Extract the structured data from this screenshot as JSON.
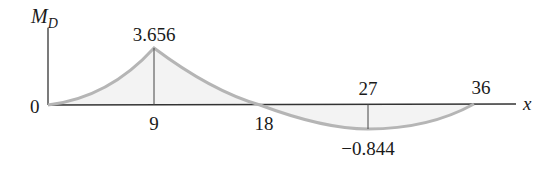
{
  "diagram": {
    "y_axis_label": "M",
    "y_axis_subscript": "D",
    "x_axis_label": "x",
    "origin_label": "0",
    "points": [
      {
        "x": 0,
        "y": 0
      },
      {
        "x": 9,
        "y": 3.656
      },
      {
        "x": 18,
        "y": 0
      },
      {
        "x": 27,
        "y": -0.844
      },
      {
        "x": 36,
        "y": 0
      }
    ],
    "tick_labels": {
      "x9": "9",
      "x18": "18",
      "x27": "27",
      "x36": "36"
    },
    "value_labels": {
      "peak": "3.656",
      "min": "−0.844"
    },
    "colors": {
      "curve": "#b5b5b5",
      "fill": "#f2f2f2",
      "axis": "#333333",
      "text": "#1a1a1a"
    }
  }
}
